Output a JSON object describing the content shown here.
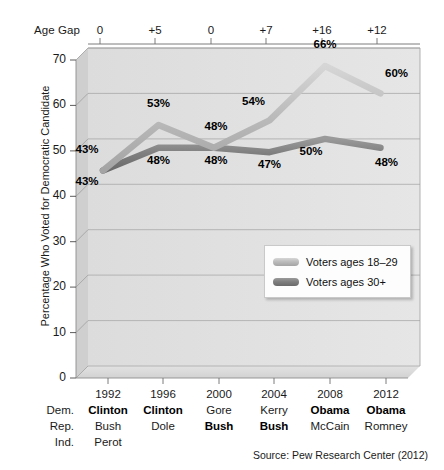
{
  "agegap": {
    "label": "Age Gap",
    "values": [
      "0",
      "+5",
      "0",
      "+7",
      "+16",
      "+12"
    ]
  },
  "yaxis": {
    "title": "Percentage Who Voted for Democratic Candidate",
    "ticks": [
      "0",
      "10",
      "20",
      "30",
      "40",
      "50",
      "60",
      "70"
    ]
  },
  "legend": {
    "items": [
      {
        "label": "Voters ages 18–29",
        "color": "#bcbcbc"
      },
      {
        "label": "Voters ages 30+",
        "color": "#7f7f7f"
      }
    ]
  },
  "table": {
    "row_labels": [
      "",
      "Dem.",
      "Rep.",
      "Ind."
    ],
    "years": [
      "1992",
      "1996",
      "2000",
      "2004",
      "2008",
      "2012"
    ],
    "dem": [
      "Clinton",
      "Clinton",
      "Gore",
      "Kerry",
      "Obama",
      "Obama"
    ],
    "rep": [
      "Bush",
      "Dole",
      "Bush",
      "Bush",
      "McCain",
      "Romney"
    ],
    "ind": [
      "Perot",
      "",
      "",
      "",
      "",
      ""
    ],
    "dem_bold": [
      true,
      true,
      false,
      false,
      true,
      true
    ],
    "rep_bold": [
      false,
      false,
      true,
      true,
      false,
      false
    ],
    "ind_bold": [
      false,
      false,
      false,
      false,
      false,
      false
    ]
  },
  "source": "Source: Pew Research Center (2012)",
  "labels": {
    "young": [
      "43%",
      "53%",
      "48%",
      "54%",
      "66%",
      "60%"
    ],
    "older": [
      "43%",
      "48%",
      "48%",
      "47%",
      "50%",
      "48%"
    ]
  },
  "chart_data": {
    "type": "line",
    "title": "",
    "xlabel": "",
    "ylabel": "Percentage Who Voted for Democratic Candidate",
    "categories": [
      "1992",
      "1996",
      "2000",
      "2004",
      "2008",
      "2012"
    ],
    "ylim": [
      0,
      70
    ],
    "yticks": [
      0,
      10,
      20,
      30,
      40,
      50,
      60,
      70
    ],
    "grid": true,
    "legend_position": "inside-lower-right",
    "series": [
      {
        "name": "Voters ages 18–29",
        "color": "#bcbcbc",
        "values": [
          43,
          53,
          48,
          54,
          66,
          60
        ]
      },
      {
        "name": "Voters ages 30+",
        "color": "#7f7f7f",
        "values": [
          43,
          48,
          48,
          47,
          50,
          48
        ]
      }
    ],
    "annotations": {
      "age_gap": [
        0,
        5,
        0,
        7,
        16,
        12
      ]
    }
  }
}
